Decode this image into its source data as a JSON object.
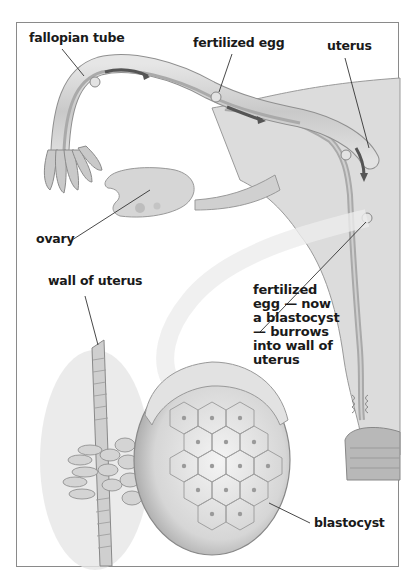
{
  "diagram": {
    "title": "",
    "labels": {
      "fallopian_tube": "fallopian tube",
      "fertilized_egg": "fertilized egg",
      "uterus": "uterus",
      "ovary": "ovary",
      "wall_of_uterus": "wall of uterus",
      "blastocyst_note": "fertilized\negg — now\na blastocyst\n— burrows\ninto wall of\nuterus",
      "blastocyst": "blastocyst"
    },
    "colors": {
      "frame_border": "#8a8a8a",
      "tissue_fill": "#d9d9d9",
      "tissue_dark": "#a8a8a8",
      "tube_lumen": "#bdbdbd",
      "arrow": "#555555",
      "leader_line": "#333333",
      "label_text": "#1a1a1a",
      "background": "#ffffff"
    }
  }
}
